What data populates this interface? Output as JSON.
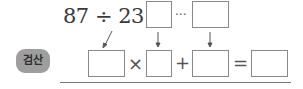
{
  "problem": {
    "expression": "87 ÷ 23 =",
    "dividend": "87",
    "divisor": "23",
    "remainder_separator": "···"
  },
  "check": {
    "badge_label": "검산",
    "times_symbol": "×",
    "plus_symbol": "+",
    "equals_symbol": "="
  },
  "answer_boxes": {
    "quotient": "",
    "remainder": "",
    "check_divisor": "",
    "check_quotient": "",
    "check_remainder": "",
    "check_result": ""
  },
  "colors": {
    "badge_bg": "#9e9e9e",
    "box_border": "#8a8a8a",
    "rule": "#777777"
  }
}
